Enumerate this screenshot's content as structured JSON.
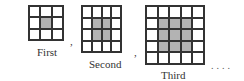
{
  "figure": {
    "sequence": [
      {
        "label": "First",
        "size": 3,
        "shaded_start": 1,
        "shaded_count": 1
      },
      {
        "label": "Second",
        "size": 4,
        "shaded_start": 1,
        "shaded_count": 2
      },
      {
        "label": "Third",
        "size": 5,
        "shaded_start": 1,
        "shaded_count": 3
      }
    ],
    "separator": ",",
    "continuation": "...."
  },
  "colors": {
    "shaded": "#b3b3b3",
    "line": "#333333",
    "background": "#ffffff"
  }
}
